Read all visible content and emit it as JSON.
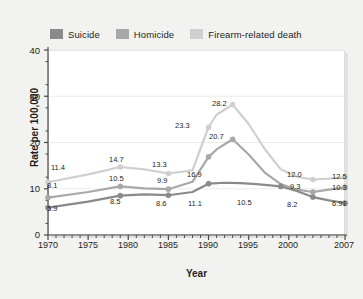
{
  "chart_data": {
    "type": "line",
    "title": "",
    "xlabel": "Year",
    "ylabel": "Rate per 100,000",
    "xlim": [
      1970,
      2007
    ],
    "ylim": [
      0,
      40
    ],
    "yticks": [
      0,
      10,
      20,
      30,
      40
    ],
    "xticks": [
      1970,
      1975,
      1980,
      1985,
      1990,
      1995,
      2000,
      2007
    ],
    "grid": "horizontal-faint",
    "legend_position": "above-plot-left",
    "colors": {
      "suicide": "#8a8a8a",
      "homicide": "#a8a8a8",
      "firearm": "#cfcfcf",
      "plot_background": "#ffffff",
      "page_background": "#f2f2f1",
      "text": "#231f20"
    },
    "series": [
      {
        "name": "Suicide",
        "color": "#8a8a8a",
        "x": [
          1970,
          1975,
          1979,
          1982,
          1985,
          1988,
          1990,
          1992,
          1994,
          1996,
          1999,
          2001,
          2003,
          2005,
          2007
        ],
        "values": [
          5.9,
          7.2,
          8.5,
          8.8,
          8.6,
          9.3,
          11.1,
          11.3,
          11.2,
          11.0,
          10.5,
          9.5,
          8.2,
          7.5,
          6.91
        ]
      },
      {
        "name": "Homicide",
        "color": "#a8a8a8",
        "x": [
          1970,
          1975,
          1979,
          1982,
          1985,
          1988,
          1990,
          1991,
          1993,
          1995,
          1997,
          1999,
          2001,
          2003,
          2005,
          2007
        ],
        "values": [
          8.1,
          9.3,
          10.5,
          10.1,
          9.9,
          11.5,
          16.9,
          18.5,
          20.7,
          17.4,
          13.5,
          11.0,
          9.8,
          9.3,
          9.8,
          10.3
        ]
      },
      {
        "name": "Firearm-related death",
        "color": "#cfcfcf",
        "x": [
          1970,
          1975,
          1979,
          1982,
          1985,
          1988,
          1990,
          1991,
          1993,
          1995,
          1997,
          1999,
          2001,
          2003,
          2005,
          2007
        ],
        "values": [
          11.4,
          13.1,
          14.7,
          14.2,
          13.3,
          14.0,
          23.3,
          26.0,
          28.2,
          24.0,
          18.6,
          14.2,
          12.6,
          12.0,
          12.2,
          12.5
        ]
      }
    ],
    "point_labels": [
      {
        "text": "11.4",
        "series": "Firearm-related death",
        "x_px": 51,
        "y_px": 163
      },
      {
        "text": "8.1",
        "series": "Homicide",
        "x_px": 47,
        "y_px": 181
      },
      {
        "text": "5.9",
        "series": "Suicide",
        "x_px": 47,
        "y_px": 204
      },
      {
        "text": "14.7",
        "series": "Firearm-related death",
        "x_px": 109,
        "y_px": 155
      },
      {
        "text": "10.5",
        "series": "Homicide",
        "x_px": 109,
        "y_px": 174
      },
      {
        "text": "8.5",
        "series": "Suicide",
        "x_px": 110,
        "y_px": 197
      },
      {
        "text": "13.3",
        "series": "Firearm-related death",
        "x_px": 152,
        "y_px": 160
      },
      {
        "text": "9.9",
        "series": "Homicide",
        "x_px": 157,
        "y_px": 176
      },
      {
        "text": "8.6",
        "series": "Suicide",
        "x_px": 156,
        "y_px": 199
      },
      {
        "text": "23.3",
        "series": "Firearm-related death",
        "x_px": 175,
        "y_px": 121
      },
      {
        "text": "16.9",
        "series": "Homicide",
        "x_px": 187,
        "y_px": 170
      },
      {
        "text": "11.1",
        "series": "Suicide",
        "x_px": 188,
        "y_px": 199
      },
      {
        "text": "28.2",
        "series": "Firearm-related death",
        "x_px": 212,
        "y_px": 99
      },
      {
        "text": "20.7",
        "series": "Homicide",
        "x_px": 209,
        "y_px": 132
      },
      {
        "text": "10.5",
        "series": "Suicide",
        "x_px": 237,
        "y_px": 198
      },
      {
        "text": "12.0",
        "series": "Firearm-related death",
        "x_px": 287,
        "y_px": 170
      },
      {
        "text": "9.3",
        "series": "Homicide",
        "x_px": 290,
        "y_px": 182
      },
      {
        "text": "8.2",
        "series": "Suicide",
        "x_px": 287,
        "y_px": 200
      },
      {
        "text": "12.5",
        "series": "Firearm-related death",
        "x_px": 332,
        "y_px": 172
      },
      {
        "text": "10.3",
        "series": "Homicide",
        "x_px": 332,
        "y_px": 183
      },
      {
        "text": "6.91",
        "series": "Suicide",
        "x_px": 332,
        "y_px": 199
      }
    ]
  },
  "legend": {
    "entries": [
      {
        "label": "Suicide",
        "color": "#8a8a8a"
      },
      {
        "label": "Homicide",
        "color": "#a8a8a8"
      },
      {
        "label": "Firearm-related death",
        "color": "#cfcfcf"
      }
    ]
  },
  "axes": {
    "y_label": "Rate per 100,000",
    "x_label": "Year",
    "y_ticks": [
      "40",
      "30",
      "20",
      "10",
      "0"
    ],
    "x_ticks": [
      "1970",
      "1975",
      "1980",
      "1985",
      "1990",
      "1995",
      "2000",
      "2007"
    ]
  }
}
